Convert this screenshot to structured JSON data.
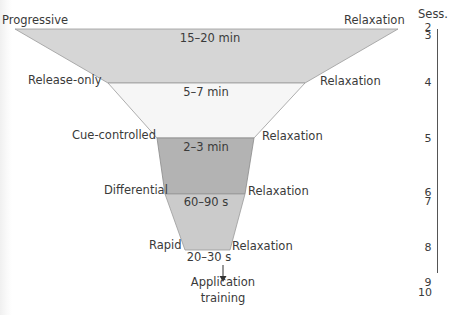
{
  "diagram": {
    "type": "funnel",
    "session_header": "Sess.",
    "bands": [
      {
        "left_label": "Progressive",
        "right_label": "Relaxation",
        "duration": "15–20 min",
        "color": "#d6d6d6"
      },
      {
        "left_label": "Release-only",
        "right_label": "Relaxation",
        "duration": "5–7 min",
        "color": "#f6f6f6"
      },
      {
        "left_label": "Cue-controlled",
        "right_label": "Relaxation",
        "duration": "2–3 min",
        "color": "#b3b3b3"
      },
      {
        "left_label": "Differential",
        "right_label": "Relaxation",
        "duration": "60–90 s",
        "color": "#cbcbcb"
      },
      {
        "left_label": "Rapid",
        "right_label": "Relaxation",
        "duration": "20–30 s"
      }
    ],
    "sessions": [
      {
        "value": "2"
      },
      {
        "value": "3"
      },
      {
        "value": "4"
      },
      {
        "value": "5"
      },
      {
        "value": "6"
      },
      {
        "value": "7"
      },
      {
        "value": "8"
      },
      {
        "value": "9"
      },
      {
        "value": "10"
      }
    ],
    "final_step": {
      "line1": "Application",
      "line2": "training"
    }
  }
}
